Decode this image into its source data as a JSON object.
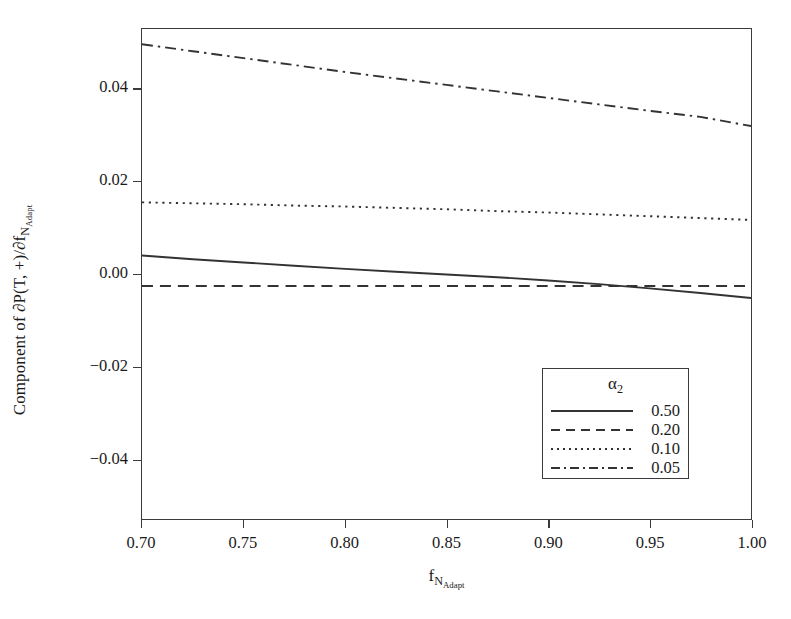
{
  "chart_data": {
    "type": "line",
    "title": "",
    "xlabel": "f_{N_Adapt}",
    "ylabel": "Component of ∂P(T, +)/∂f_{N_Adapt}",
    "xlim": [
      0.7,
      1.0
    ],
    "ylim": [
      -0.053,
      0.053
    ],
    "xticks": [
      0.7,
      0.75,
      0.8,
      0.85,
      0.9,
      0.95,
      1.0
    ],
    "xticklabels": [
      "0.70",
      "0.75",
      "0.80",
      "0.85",
      "0.90",
      "0.95",
      "1.00"
    ],
    "yticks": [
      0.04,
      0.02,
      0.0,
      -0.02,
      -0.04
    ],
    "yticklabels": [
      "0.04",
      "0.02",
      "0.00",
      "−0.02",
      "−0.04"
    ],
    "grid": false,
    "legend_position": "lower right",
    "legend_title": "α₂",
    "line_color": "#333333",
    "x": [
      0.7,
      0.725,
      0.75,
      0.775,
      0.8,
      0.825,
      0.85,
      0.875,
      0.9,
      0.925,
      0.95,
      0.975,
      1.0
    ],
    "series": [
      {
        "name": "0.50",
        "label": "0.50",
        "dash": "solid",
        "values": [
          0.004,
          0.0032,
          0.0025,
          0.0018,
          0.0011,
          0.0005,
          -0.0001,
          -0.0007,
          -0.0014,
          -0.0022,
          -0.0031,
          -0.0041,
          -0.0052
        ]
      },
      {
        "name": "0.20",
        "label": "0.20",
        "dash": "dashed",
        "values": [
          -0.0026,
          -0.0026,
          -0.0026,
          -0.0026,
          -0.0026,
          -0.0026,
          -0.0026,
          -0.0026,
          -0.0026,
          -0.0026,
          -0.0026,
          -0.0026,
          -0.0026
        ]
      },
      {
        "name": "0.10",
        "label": "0.10",
        "dash": "dotted",
        "values": [
          0.0155,
          0.0153,
          0.0151,
          0.0148,
          0.0146,
          0.0143,
          0.014,
          0.0136,
          0.0133,
          0.0129,
          0.0125,
          0.0121,
          0.0117
        ]
      },
      {
        "name": "0.05",
        "label": "0.05",
        "dash": "dashdot",
        "values": [
          0.0497,
          0.0482,
          0.0467,
          0.0452,
          0.0437,
          0.0423,
          0.0409,
          0.0395,
          0.0381,
          0.0367,
          0.0353,
          0.034,
          0.032
        ]
      }
    ]
  },
  "axes": {
    "ylabel_parts": {
      "prefix": "Component of ∂P(T, +)/∂f",
      "sub_main": "N",
      "sub_sub": "Adapt"
    },
    "xlabel_parts": {
      "prefix": "f",
      "sub_main": "N",
      "sub_sub": "Adapt"
    }
  },
  "legend": {
    "title": "α",
    "title_sub": "2",
    "items": [
      {
        "label": "0.50",
        "dash": "solid"
      },
      {
        "label": "0.20",
        "dash": "dashed"
      },
      {
        "label": "0.10",
        "dash": "dotted"
      },
      {
        "label": "0.05",
        "dash": "dashdot"
      }
    ]
  }
}
